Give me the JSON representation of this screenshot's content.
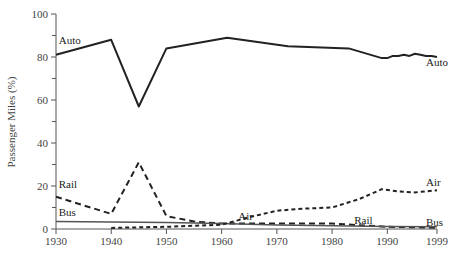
{
  "chart_data": {
    "type": "line",
    "title": "",
    "xlabel": "",
    "ylabel": "Passenger Miles (%)",
    "xlim": [
      1930,
      1999
    ],
    "ylim": [
      0,
      100
    ],
    "x_ticks": [
      1930,
      1940,
      1950,
      1960,
      1970,
      1980,
      1990,
      1999
    ],
    "y_ticks": [
      0,
      20,
      40,
      60,
      80,
      100
    ],
    "y_minor_ticks": [
      10,
      30,
      50,
      70,
      90
    ],
    "grid": false,
    "legend": "inline labels",
    "series": [
      {
        "name": "Auto",
        "style": "solid",
        "color": "#222222",
        "width": 2,
        "x": [
          1930,
          1940,
          1945,
          1950,
          1961,
          1972,
          1983,
          1989,
          1990,
          1991,
          1992,
          1993,
          1994,
          1995,
          1996,
          1997,
          1998,
          1999
        ],
        "y": [
          81,
          88,
          57,
          84,
          89,
          85,
          84,
          79.5,
          79.5,
          80.5,
          80.5,
          81,
          80.5,
          81.5,
          81,
          80.5,
          80.5,
          80
        ]
      },
      {
        "name": "Rail",
        "style": "dashed",
        "color": "#222222",
        "width": 2,
        "x": [
          1930,
          1940,
          1945,
          1950,
          1955,
          1960,
          1970,
          1980,
          1987,
          1990,
          1995,
          1999
        ],
        "y": [
          15,
          7,
          31,
          6,
          3.5,
          2.5,
          2.5,
          2.5,
          1.5,
          1,
          0.8,
          0.6
        ]
      },
      {
        "name": "Bus",
        "style": "solid",
        "color": "#555555",
        "width": 1.5,
        "x": [
          1930,
          1940,
          1950,
          1960,
          1970,
          1980,
          1990,
          1999
        ],
        "y": [
          3.5,
          3.3,
          3,
          2.5,
          1.8,
          1.5,
          1.2,
          1
        ]
      },
      {
        "name": "Air",
        "style": "dotted",
        "color": "#222222",
        "width": 2,
        "x": [
          1940,
          1950,
          1955,
          1960,
          1965,
          1970,
          1975,
          1980,
          1985,
          1989,
          1992,
          1995,
          1999
        ],
        "y": [
          0.5,
          1,
          1.5,
          2,
          5.5,
          8.5,
          9.5,
          10,
          14,
          18.5,
          17.5,
          17,
          18
        ]
      }
    ],
    "annotations": [
      {
        "text": "Auto",
        "x": 1930.5,
        "y": 86
      },
      {
        "text": "Auto",
        "x": 1997,
        "y": 76
      },
      {
        "text": "Rail",
        "x": 1930.5,
        "y": 19
      },
      {
        "text": "Bus",
        "x": 1930.5,
        "y": 6
      },
      {
        "text": "Air",
        "x": 1963,
        "y": 4
      },
      {
        "text": "Rail",
        "x": 1984,
        "y": 2.2
      },
      {
        "text": "Air",
        "x": 1997,
        "y": 20
      },
      {
        "text": "Bus",
        "x": 1997,
        "y": 1.5
      }
    ]
  },
  "labels": {
    "ylabel": "Passenger Miles (%)"
  }
}
